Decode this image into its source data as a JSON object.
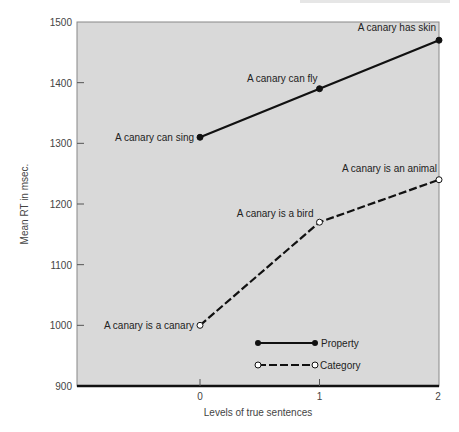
{
  "chart_data": {
    "type": "line",
    "title": "",
    "xlabel": "Levels of true sentences",
    "ylabel": "Mean RT in msec.",
    "x": [
      0,
      1,
      2
    ],
    "x_ticks": [
      "0",
      "1",
      "2"
    ],
    "y_ticks": [
      "900",
      "1000",
      "1100",
      "1200",
      "1300",
      "1400",
      "1500"
    ],
    "ylim": [
      900,
      1500
    ],
    "xlim": [
      -1.5,
      2
    ],
    "grid": false,
    "legend_position": "lower center (inside plot)",
    "series": [
      {
        "name": "Property",
        "style": "solid line, filled circle markers",
        "values": [
          1310,
          1390,
          1470
        ],
        "labels": [
          "A canary can sing",
          "A canary can fly",
          "A canary has skin"
        ]
      },
      {
        "name": "Category",
        "style": "dashed line, open circle markers",
        "values": [
          1000,
          1170,
          1240
        ],
        "labels": [
          "A canary is a canary",
          "A canary is a bird",
          "A canary is an animal"
        ]
      }
    ],
    "colors": {
      "plot_background": "#d9d9d9",
      "line": "#111111"
    }
  }
}
